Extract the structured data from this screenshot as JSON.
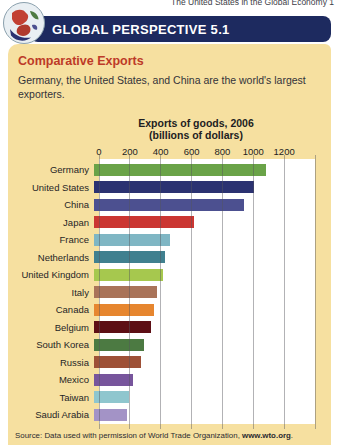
{
  "page": {
    "running_head": "The United States in the Global Economy 1",
    "banner_title": "GLOBAL PERSPECTIVE 5.1",
    "heading": "Comparative Exports",
    "description": "Germany, the United States, and China are the world's largest exporters.",
    "source_prefix": "Source: Data used with permission of World Trade Organization, ",
    "source_link": "www.wto.org",
    "source_suffix": "."
  },
  "colors": {
    "banner_bg": "#1d2a5f",
    "panel_bg": "#f6e0a0",
    "heading_red": "#bd3a28",
    "plot_bg": "#ffffff",
    "gridline": "#55555a"
  },
  "chart_data": {
    "type": "bar",
    "orientation": "horizontal",
    "title": "Exports of goods, 2006",
    "subtitle": "(billions of dollars)",
    "ticks": [
      0,
      200,
      400,
      600,
      800,
      1000,
      1200
    ],
    "grid_values": [
      0,
      200,
      400,
      600,
      800,
      1000,
      1200,
      1400
    ],
    "xlim": [
      0,
      1400
    ],
    "grid": true,
    "legend": "none",
    "categories": [
      "Germany",
      "United States",
      "China",
      "Japan",
      "France",
      "Netherlands",
      "United Kingdom",
      "Italy",
      "Canada",
      "Belgium",
      "South Korea",
      "Russia",
      "Mexico",
      "Taiwan",
      "Saudi Arabia"
    ],
    "values": [
      1112,
      1038,
      969,
      650,
      490,
      462,
      448,
      410,
      388,
      369,
      326,
      305,
      250,
      224,
      211
    ],
    "bar_colors": [
      "#6aa348",
      "#2b3271",
      "#4c5090",
      "#cb3632",
      "#7fb6c4",
      "#40808f",
      "#a6c84e",
      "#a97359",
      "#e6862f",
      "#5d0f15",
      "#4c7a42",
      "#9e5137",
      "#77559c",
      "#8fc6ce",
      "#a393c6"
    ]
  }
}
